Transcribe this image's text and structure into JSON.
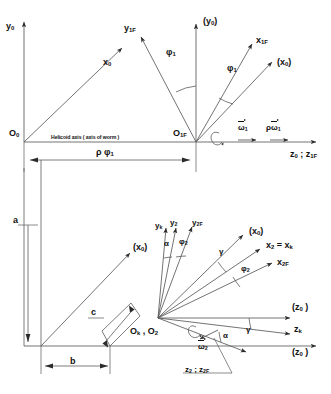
{
  "figure": {
    "type": "engineering-kinematic-diagram",
    "line_color": "#4a4a4a",
    "text_color": "#111111",
    "background": "#ffffff"
  },
  "upper_diagram": {
    "name": "worm-helicoid-coordinate-frames",
    "note_text": "Helicoid axis ( axis of worm )",
    "origins": [
      {
        "id": "O0",
        "base": "O",
        "sub": "0"
      },
      {
        "id": "O1F",
        "base": "O",
        "sub": "1F"
      }
    ],
    "axes": [
      {
        "id": "y0-left",
        "base": "y",
        "sub": "0",
        "bracketed": false
      },
      {
        "id": "y0-mid",
        "base": "y",
        "sub": "0",
        "bracketed": true
      },
      {
        "id": "y1F",
        "base": "y",
        "sub": "1F",
        "bracketed": false
      },
      {
        "id": "x0-left",
        "base": "x",
        "sub": "0",
        "bracketed": false
      },
      {
        "id": "x1F",
        "base": "x",
        "sub": "1F",
        "bracketed": false
      },
      {
        "id": "x0-right",
        "base": "x",
        "sub": "0",
        "bracketed": true
      },
      {
        "id": "z0-z1F",
        "base": "z",
        "sub": "0",
        "base2": "z",
        "sub2": "1F",
        "separator": " ; ",
        "bracketed": false
      }
    ],
    "angles": [
      {
        "id": "phi1-left",
        "symbol": "φ",
        "sub": "1"
      },
      {
        "id": "phi1-right",
        "symbol": "φ",
        "sub": "1"
      }
    ],
    "vectors": [
      {
        "id": "omega1",
        "symbol": "ω",
        "sub": "1",
        "prefix": "",
        "overbar": true
      },
      {
        "id": "rho-omega1",
        "symbol": "ω",
        "sub": "1",
        "prefix": "ρ",
        "overbar": true
      }
    ],
    "dimensions": [
      {
        "id": "rho-phi1",
        "label_rho": "ρ",
        "label_phi": "φ",
        "sub": "1"
      }
    ],
    "rotation_marker": {
      "id": "rotation-arc-1",
      "label": ""
    }
  },
  "lower_diagram": {
    "name": "tool-workpiece-coordinate-frames",
    "origins": [
      {
        "id": "Ok-O2",
        "text": "O",
        "sub1": "k",
        "sep": " , O",
        "sub2": "2"
      }
    ],
    "axes": [
      {
        "id": "yk",
        "base": "y",
        "sub": "k",
        "bracketed": false
      },
      {
        "id": "y2",
        "base": "y",
        "sub": "2",
        "bracketed": false
      },
      {
        "id": "y2F",
        "base": "y",
        "sub": "2F",
        "bracketed": false
      },
      {
        "id": "x0-lower-left",
        "base": "x",
        "sub": "0",
        "bracketed": true
      },
      {
        "id": "x0-lower-right",
        "base": "x",
        "sub": "0",
        "bracketed": true
      },
      {
        "id": "x2-xk",
        "base": "x",
        "sub": "2",
        "eq": " = ",
        "base2": "x",
        "sub2": "k",
        "bracketed": false
      },
      {
        "id": "x2F",
        "base": "x",
        "sub": "2F",
        "bracketed": false
      },
      {
        "id": "z0-right",
        "base": "z",
        "sub": "0",
        "bracketed": true
      },
      {
        "id": "zk",
        "base": "z",
        "sub": "k",
        "bracketed": false
      },
      {
        "id": "z0-bottom",
        "base": "z",
        "sub": "0",
        "bracketed": true
      },
      {
        "id": "z2-z2F",
        "base": "z",
        "sub": "2",
        "base2": "z",
        "sub2": "2F",
        "separator": " ; ",
        "bracketed": false
      }
    ],
    "angles": [
      {
        "id": "alpha-top",
        "symbol": "α",
        "sub": ""
      },
      {
        "id": "phi2-top",
        "symbol": "φ",
        "sub": "2"
      },
      {
        "id": "gamma-upper",
        "symbol": "γ",
        "sub": ""
      },
      {
        "id": "phi2-right",
        "symbol": "φ",
        "sub": "2"
      },
      {
        "id": "gamma-lower",
        "symbol": "γ",
        "sub": ""
      },
      {
        "id": "alpha-lower",
        "symbol": "α",
        "sub": ""
      }
    ],
    "vectors": [
      {
        "id": "omega2",
        "symbol": "ω",
        "sub": "2",
        "overbar": true
      }
    ],
    "dimensions": [
      {
        "id": "dim-a",
        "label": "a"
      },
      {
        "id": "dim-b",
        "label": "b"
      },
      {
        "id": "dim-c",
        "label": "c"
      }
    ],
    "rotation_marker": {
      "id": "rotation-arc-2",
      "label": ""
    }
  }
}
